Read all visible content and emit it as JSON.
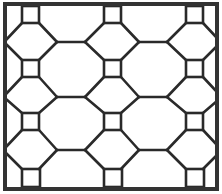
{
  "figure": {
    "title": "",
    "colors": {
      "background": "#ffffff",
      "stroke": "#2a2a2a",
      "frame": "#333333"
    },
    "frame": {
      "x": 5,
      "y": 4,
      "width": 212,
      "height": 185,
      "stroke_width": 4
    },
    "squares": [
      {
        "x": 22,
        "y": 6,
        "size": 17
      },
      {
        "x": 104,
        "y": 6,
        "size": 17
      },
      {
        "x": 186,
        "y": 6,
        "size": 17
      },
      {
        "x": 22,
        "y": 60,
        "size": 17
      },
      {
        "x": 104,
        "y": 60,
        "size": 17
      },
      {
        "x": 186,
        "y": 60,
        "size": 17
      },
      {
        "x": 22,
        "y": 113,
        "size": 17
      },
      {
        "x": 104,
        "y": 113,
        "size": 17
      },
      {
        "x": 186,
        "y": 113,
        "size": 17
      },
      {
        "x": 22,
        "y": 169,
        "size": 18
      },
      {
        "x": 104,
        "y": 169,
        "size": 18
      },
      {
        "x": 186,
        "y": 169,
        "size": 18
      }
    ],
    "lines": [
      [
        39,
        23,
        57,
        42
      ],
      [
        57,
        42,
        85,
        42
      ],
      [
        85,
        42,
        104,
        23
      ],
      [
        121,
        23,
        139,
        42
      ],
      [
        139,
        42,
        167,
        42
      ],
      [
        167,
        42,
        186,
        23
      ],
      [
        22,
        23,
        6,
        40
      ],
      [
        203,
        23,
        217,
        38
      ],
      [
        57,
        42,
        39,
        60
      ],
      [
        85,
        42,
        104,
        60
      ],
      [
        139,
        42,
        121,
        60
      ],
      [
        167,
        42,
        186,
        60
      ],
      [
        22,
        60,
        6,
        44
      ],
      [
        203,
        60,
        217,
        46
      ],
      [
        39,
        77,
        57,
        97
      ],
      [
        57,
        97,
        85,
        97
      ],
      [
        85,
        97,
        104,
        77
      ],
      [
        121,
        77,
        139,
        97
      ],
      [
        139,
        97,
        167,
        97
      ],
      [
        167,
        97,
        186,
        77
      ],
      [
        22,
        77,
        6,
        94
      ],
      [
        203,
        77,
        217,
        92
      ],
      [
        57,
        97,
        39,
        113
      ],
      [
        85,
        97,
        104,
        113
      ],
      [
        139,
        97,
        121,
        113
      ],
      [
        167,
        97,
        186,
        113
      ],
      [
        22,
        113,
        6,
        99
      ],
      [
        203,
        113,
        217,
        101
      ],
      [
        39,
        130,
        57,
        150
      ],
      [
        57,
        150,
        85,
        150
      ],
      [
        85,
        150,
        104,
        130
      ],
      [
        121,
        130,
        139,
        150
      ],
      [
        139,
        150,
        167,
        150
      ],
      [
        167,
        150,
        186,
        130
      ],
      [
        22,
        130,
        6,
        147
      ],
      [
        203,
        130,
        217,
        145
      ],
      [
        57,
        150,
        39,
        169
      ],
      [
        85,
        150,
        104,
        169
      ],
      [
        139,
        150,
        121,
        169
      ],
      [
        167,
        150,
        186,
        169
      ],
      [
        22,
        169,
        6,
        153
      ],
      [
        203,
        169,
        217,
        155
      ]
    ]
  }
}
